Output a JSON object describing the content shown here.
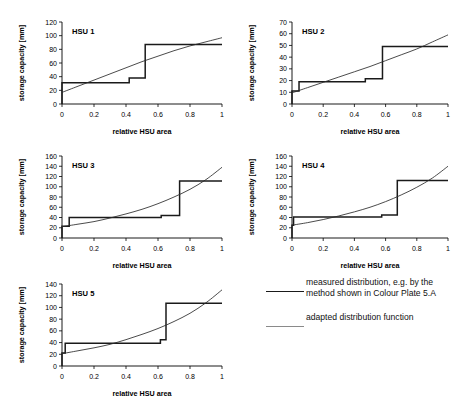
{
  "figure": {
    "width": 460,
    "height": 400,
    "background": "#ffffff",
    "line_colors": {
      "measured": "#1a1a1a",
      "adapted": "#2b2b2b",
      "legend_adapted_swatch": "#8a8a8a",
      "axis": "#000000"
    }
  },
  "legend": {
    "entries": [
      {
        "key": "measured",
        "label": "measured distribution, e.g. by the method shown in Colour Plate 5.A",
        "swatch": "thick-black-line"
      },
      {
        "key": "adapted",
        "label": "adapted distribution function",
        "swatch": "thin-grey-line"
      }
    ]
  },
  "chart_data": [
    {
      "type": "line",
      "title": "HSU 1",
      "xlabel": "relative HSU area",
      "ylabel": "storage capacity [mm]",
      "xlim": [
        0,
        1
      ],
      "ylim": [
        0,
        120
      ],
      "xticks": [
        0,
        0.2,
        0.4,
        0.6,
        0.8,
        1
      ],
      "xticklabels": [
        "0",
        "0.2",
        "0.4",
        "0.6",
        "0.8",
        "1"
      ],
      "yticks": [
        0,
        20,
        40,
        60,
        80,
        100,
        120
      ],
      "yticklabels": [
        "0",
        "20",
        "40",
        "60",
        "80",
        "100",
        "120"
      ],
      "grid": false,
      "legend_position": "outside-right",
      "series": [
        {
          "name": "measured distribution",
          "style": "step",
          "x": [
            0,
            0,
            0.42,
            0.42,
            0.52,
            0.52,
            1
          ],
          "y": [
            0,
            31,
            31,
            38,
            38,
            87,
            87
          ]
        },
        {
          "name": "adapted distribution function",
          "style": "curve",
          "x": [
            0,
            0.1,
            0.2,
            0.3,
            0.4,
            0.5,
            0.6,
            0.7,
            0.8,
            0.9,
            1
          ],
          "y": [
            17,
            26,
            35,
            44,
            53,
            62,
            70,
            78,
            85,
            91,
            97
          ]
        }
      ]
    },
    {
      "type": "line",
      "title": "HSU 2",
      "xlabel": "relative HSU area",
      "ylabel": "storage capacity [mm]",
      "xlim": [
        0,
        1
      ],
      "ylim": [
        0,
        70
      ],
      "xticks": [
        0,
        0.2,
        0.4,
        0.6,
        0.8,
        1
      ],
      "xticklabels": [
        "0",
        "0.2",
        "0.4",
        "0.6",
        "0.8",
        "1"
      ],
      "yticks": [
        0,
        10,
        20,
        30,
        40,
        50,
        60,
        70
      ],
      "yticklabels": [
        "0",
        "10",
        "20",
        "30",
        "40",
        "50",
        "60",
        "70"
      ],
      "grid": false,
      "legend_position": "outside-right",
      "series": [
        {
          "name": "measured distribution",
          "style": "step",
          "x": [
            0,
            0,
            0.045,
            0.045,
            0.47,
            0.47,
            0.58,
            0.58,
            1
          ],
          "y": [
            0,
            11,
            11,
            19,
            19,
            21.5,
            21.5,
            49,
            49
          ]
        },
        {
          "name": "adapted distribution function",
          "style": "curve",
          "x": [
            0,
            0.1,
            0.2,
            0.3,
            0.4,
            0.5,
            0.6,
            0.7,
            0.8,
            0.9,
            1
          ],
          "y": [
            9.5,
            14,
            18.5,
            23,
            27.5,
            32,
            37,
            42,
            47,
            53,
            59
          ]
        }
      ]
    },
    {
      "type": "line",
      "title": "HSU 3",
      "xlabel": "relative HSU area",
      "ylabel": "storage capacity [mm]",
      "xlim": [
        0,
        1
      ],
      "ylim": [
        0,
        160
      ],
      "xticks": [
        0,
        0.2,
        0.4,
        0.6,
        0.8,
        1
      ],
      "xticklabels": [
        "0",
        "0.2",
        "0.4",
        "0.6",
        "0.8",
        "1"
      ],
      "yticks": [
        0,
        20,
        40,
        60,
        80,
        100,
        120,
        140,
        160
      ],
      "yticklabels": [
        "0",
        "20",
        "40",
        "60",
        "80",
        "100",
        "120",
        "140",
        "160"
      ],
      "grid": false,
      "legend_position": "outside-right",
      "series": [
        {
          "name": "measured distribution",
          "style": "step",
          "x": [
            0,
            0,
            0.045,
            0.045,
            0.62,
            0.62,
            0.735,
            0.735,
            1
          ],
          "y": [
            0,
            23,
            23,
            40,
            40,
            44,
            44,
            111,
            111
          ]
        },
        {
          "name": "adapted distribution function",
          "style": "curve",
          "x": [
            0,
            0.1,
            0.2,
            0.3,
            0.4,
            0.5,
            0.6,
            0.7,
            0.8,
            0.9,
            1
          ],
          "y": [
            22,
            27,
            32,
            39,
            47,
            56,
            67,
            80,
            95,
            114,
            138
          ]
        }
      ]
    },
    {
      "type": "line",
      "title": "HSU 4",
      "xlabel": "relative HSU area",
      "ylabel": "storage capacity  [mm]",
      "xlim": [
        0,
        1
      ],
      "ylim": [
        0,
        160
      ],
      "xticks": [
        0,
        0.2,
        0.4,
        0.6,
        0.8,
        1
      ],
      "xticklabels": [
        "0",
        "0.2",
        "0.4",
        "0.6",
        "0.8",
        "1"
      ],
      "yticks": [
        0,
        20,
        40,
        60,
        80,
        100,
        120,
        140,
        160
      ],
      "yticklabels": [
        "0",
        "20",
        "40",
        "60",
        "80",
        "100",
        "120",
        "140",
        "160"
      ],
      "grid": false,
      "legend_position": "outside-right",
      "series": [
        {
          "name": "measured distribution",
          "style": "step",
          "x": [
            0,
            0,
            0.01,
            0.01,
            0.575,
            0.575,
            0.675,
            0.675,
            1
          ],
          "y": [
            0,
            25,
            25,
            41,
            41,
            45,
            45,
            112,
            112
          ]
        },
        {
          "name": "adapted distribution function",
          "style": "curve",
          "x": [
            0,
            0.1,
            0.2,
            0.3,
            0.4,
            0.5,
            0.6,
            0.7,
            0.8,
            0.9,
            1
          ],
          "y": [
            25,
            30,
            36,
            43,
            51,
            60,
            71,
            84,
            99,
            117,
            140
          ]
        }
      ]
    },
    {
      "type": "line",
      "title": "HSU 5",
      "xlabel": "relative HSU area",
      "ylabel": "storage capacity [mm]",
      "xlim": [
        0,
        1
      ],
      "ylim": [
        0,
        140
      ],
      "xticks": [
        0,
        0.2,
        0.4,
        0.6,
        0.8,
        1
      ],
      "xticklabels": [
        "0",
        "0.2",
        "0.4",
        "0.6",
        "0.8",
        "1"
      ],
      "yticks": [
        0,
        20,
        40,
        60,
        80,
        100,
        120,
        140
      ],
      "yticklabels": [
        "0",
        "20",
        "40",
        "60",
        "80",
        "100",
        "120",
        "140"
      ],
      "grid": false,
      "legend_position": "outside-right",
      "series": [
        {
          "name": "measured distribution",
          "style": "step",
          "x": [
            0,
            0,
            0.02,
            0.02,
            0.615,
            0.615,
            0.65,
            0.65,
            1
          ],
          "y": [
            0,
            22,
            22,
            39,
            39,
            45,
            45,
            107,
            107
          ]
        },
        {
          "name": "adapted distribution function",
          "style": "curve",
          "x": [
            0,
            0.1,
            0.2,
            0.3,
            0.4,
            0.5,
            0.6,
            0.7,
            0.8,
            0.9,
            1
          ],
          "y": [
            21,
            26,
            31,
            37,
            45,
            54,
            64,
            76,
            90,
            108,
            130
          ]
        }
      ]
    }
  ],
  "panel_layout": [
    {
      "left": 14,
      "top": 10,
      "width": 216,
      "height": 130
    },
    {
      "left": 244,
      "top": 10,
      "width": 212,
      "height": 130
    },
    {
      "left": 14,
      "top": 144,
      "width": 216,
      "height": 130
    },
    {
      "left": 244,
      "top": 144,
      "width": 212,
      "height": 130
    },
    {
      "left": 14,
      "top": 272,
      "width": 216,
      "height": 130
    }
  ]
}
